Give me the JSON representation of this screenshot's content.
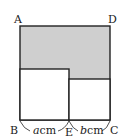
{
  "diagram": {
    "type": "geometry",
    "colors": {
      "shade": "#cfcfcf",
      "stroke": "#222222",
      "background": "#ffffff"
    },
    "points": {
      "A": "A",
      "B": "B",
      "C": "C",
      "D": "D",
      "E": "E"
    },
    "segments": {
      "BE": {
        "variable": "a",
        "unit": "cm"
      },
      "EC": {
        "variable": "b",
        "unit": "cm"
      }
    },
    "shapes": [
      {
        "name": "outer-square-ABCD",
        "shaded": false
      },
      {
        "name": "square-side-a",
        "shaded": false
      },
      {
        "name": "square-side-b",
        "shaded": false
      },
      {
        "name": "shaded-region",
        "shaded": true
      }
    ]
  }
}
